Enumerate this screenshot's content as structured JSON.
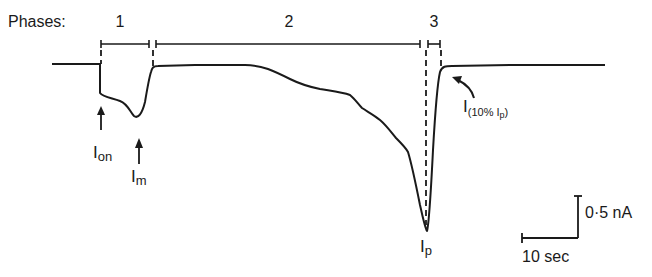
{
  "figure": {
    "phases_label": "Phases:",
    "phases": [
      {
        "label": "1",
        "x_start": 101,
        "x_end": 149
      },
      {
        "label": "2",
        "x_start": 155,
        "x_end": 420
      },
      {
        "label": "3",
        "x_start": 426,
        "x_end": 441
      }
    ],
    "annotations": {
      "i_on": {
        "main": "I",
        "sub": "on"
      },
      "i_m": {
        "main": "I",
        "sub": "m"
      },
      "i_p": {
        "main": "I",
        "sub": "p"
      },
      "i_10": {
        "main": "I",
        "sub": "(10% I",
        "sub2": "p",
        "sub_end": ")"
      }
    },
    "scale_bar": {
      "current_label": "0·5 nA",
      "time_label": "10 sec"
    },
    "colors": {
      "ink": "#1a1a1a",
      "background": "#ffffff"
    }
  }
}
